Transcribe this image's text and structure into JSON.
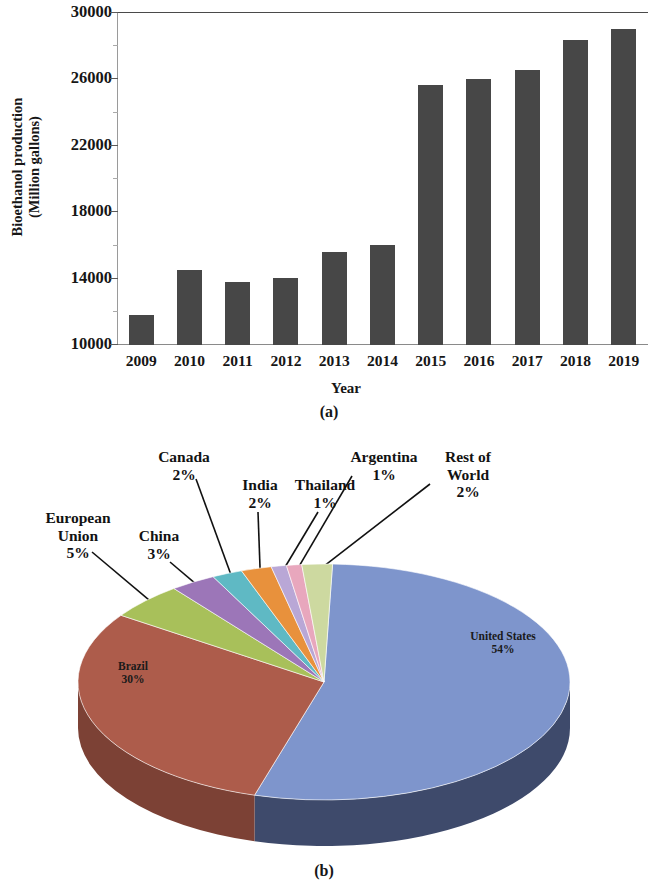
{
  "figure": {
    "panel_a_caption": "(a)",
    "panel_b_caption": "(b)"
  },
  "chart_data": [
    {
      "type": "bar",
      "panel": "(a)",
      "title": "",
      "xlabel": "Year",
      "ylabel": "Bioethanol production\n(Million gallons)",
      "ylabel_line1": "Bioethanol production",
      "ylabel_line2": "(Million gallons)",
      "categories": [
        "2009",
        "2010",
        "2011",
        "2012",
        "2013",
        "2014",
        "2015",
        "2016",
        "2017",
        "2018",
        "2019"
      ],
      "values": [
        11800,
        14500,
        13800,
        14000,
        15600,
        16000,
        25600,
        26000,
        26500,
        28300,
        29000
      ],
      "ylim": [
        10000,
        30000
      ],
      "yticks": [
        30000,
        26000,
        22000,
        18000,
        14000,
        10000
      ],
      "ytick_labels": [
        "30000",
        "26000",
        "22000",
        "18000",
        "14000",
        "10000"
      ],
      "grid": false,
      "legend": "none",
      "bar_color": "#474747"
    },
    {
      "type": "pie",
      "panel": "(b)",
      "title": "",
      "labels": [
        "United States",
        "Brazil",
        "European Union",
        "China",
        "Canada",
        "India",
        "Thailand",
        "Argentina",
        "Rest of World"
      ],
      "values": [
        54,
        30,
        5,
        3,
        2,
        2,
        1,
        1,
        2
      ],
      "value_labels": [
        "54%",
        "30%",
        "5%",
        "3%",
        "2%",
        "2%",
        "1%",
        "1%",
        "2%"
      ],
      "colors": [
        "#7e95cc",
        "#ad5c4b",
        "#a8c05a",
        "#9c76b8",
        "#5fb9c4",
        "#e8913c",
        "#b9a7d6",
        "#e8a7bd",
        "#cdd9a0"
      ],
      "side_colors": [
        "#3e4a6b",
        "#7c4135",
        "#7a8c3f",
        "#6f527f",
        "#44838b",
        "#a4642a",
        "#837498",
        "#a47584",
        "#92996f"
      ],
      "legend": "callouts",
      "effect": "3d"
    }
  ],
  "bar_chart": {
    "y_axis_title_line1": "Bioethanol production",
    "y_axis_title_line2": "(Million gallons)",
    "x_axis_title": "Year",
    "y_tick_labels": [
      "30000",
      "26000",
      "22000",
      "18000",
      "14000",
      "10000"
    ],
    "x_tick_labels": [
      "2009",
      "2010",
      "2011",
      "2012",
      "2013",
      "2014",
      "2015",
      "2016",
      "2017",
      "2018",
      "2019"
    ]
  },
  "pie_chart": {
    "callouts": [
      {
        "name": "european-union",
        "label_line1": "European",
        "label_line2": "Union",
        "value": "5%"
      },
      {
        "name": "china",
        "label_line1": "China",
        "label_line2": "",
        "value": "3%"
      },
      {
        "name": "canada",
        "label_line1": "Canada",
        "label_line2": "",
        "value": "2%"
      },
      {
        "name": "india",
        "label_line1": "India",
        "label_line2": "",
        "value": "2%"
      },
      {
        "name": "thailand",
        "label_line1": "Thailand",
        "label_line2": "",
        "value": "1%"
      },
      {
        "name": "argentina",
        "label_line1": "Argentina",
        "label_line2": "",
        "value": "1%"
      },
      {
        "name": "rest-of-world",
        "label_line1": "Rest of",
        "label_line2": "World",
        "value": "2%"
      }
    ],
    "inner_labels": [
      {
        "name": "united-states",
        "label": "United States",
        "value": "54%"
      },
      {
        "name": "brazil",
        "label": "Brazil",
        "value": "30%"
      }
    ]
  }
}
